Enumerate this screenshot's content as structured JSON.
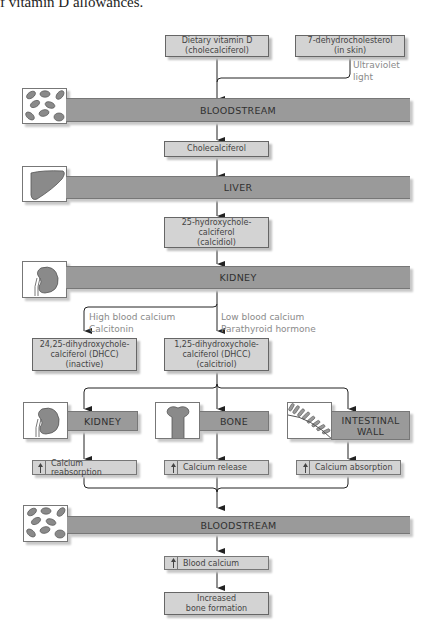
{
  "caption": "f vitamin D allowances.",
  "sources": {
    "dietary": {
      "line1": "Dietary vitamin D",
      "line2": "(cholecalciferol)"
    },
    "skin": {
      "line1": "7-dehydrocholesterol",
      "line2": "(in skin)"
    },
    "uv_label": {
      "line1": "Ultraviolet",
      "line2": "light"
    }
  },
  "bars": {
    "bloodstream_top": "BLOODSTREAM",
    "liver": "LIVER",
    "kidney": "KIDNEY",
    "bloodstream_bottom": "BLOODSTREAM"
  },
  "intermediates": {
    "cholecalciferol": "Cholecalciferol",
    "calcidiol": {
      "line1": "25-hydroxychole-",
      "line2": "calciferol",
      "line3": "(calcidiol)"
    }
  },
  "branch": {
    "high": {
      "line1": "High blood calcium",
      "line2": "Calcitonin"
    },
    "low": {
      "line1": "Low blood calcium",
      "line2": "Parathyroid hormone"
    },
    "inactive": {
      "line1": "24,25-dihydroxychole-",
      "line2": "calciferol (DHCC)",
      "line3": "(inactive)"
    },
    "calcitriol": {
      "line1": "1,25-dihydroxychole-",
      "line2": "calciferol (DHCC)",
      "line3": "(calcitriol)"
    }
  },
  "targets": [
    {
      "organ": "KIDNEY",
      "effect": "Calcium reabsorption"
    },
    {
      "organ": "BONE",
      "effect": "Calcium release"
    },
    {
      "organ_line1": "INTESTINAL",
      "organ_line2": "WALL",
      "effect": "Calcium absorption"
    }
  ],
  "outcomes": {
    "blood_calcium": "Blood calcium",
    "bone_formation": {
      "line1": "Increased",
      "line2": "bone formation"
    }
  },
  "colors": {
    "bar": "#9a9a9a",
    "box": "#d3d3d3",
    "label": "#8a8a8a",
    "line": "#222222"
  }
}
